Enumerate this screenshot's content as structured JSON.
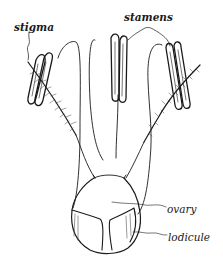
{
  "figure": {
    "labels": {
      "stigma": "stigma",
      "stamens": "stamens",
      "ovary": "ovary",
      "lodicule": "lodicule"
    },
    "colors": {
      "ink": "#1a1a1a",
      "background": "#ffffff"
    }
  }
}
